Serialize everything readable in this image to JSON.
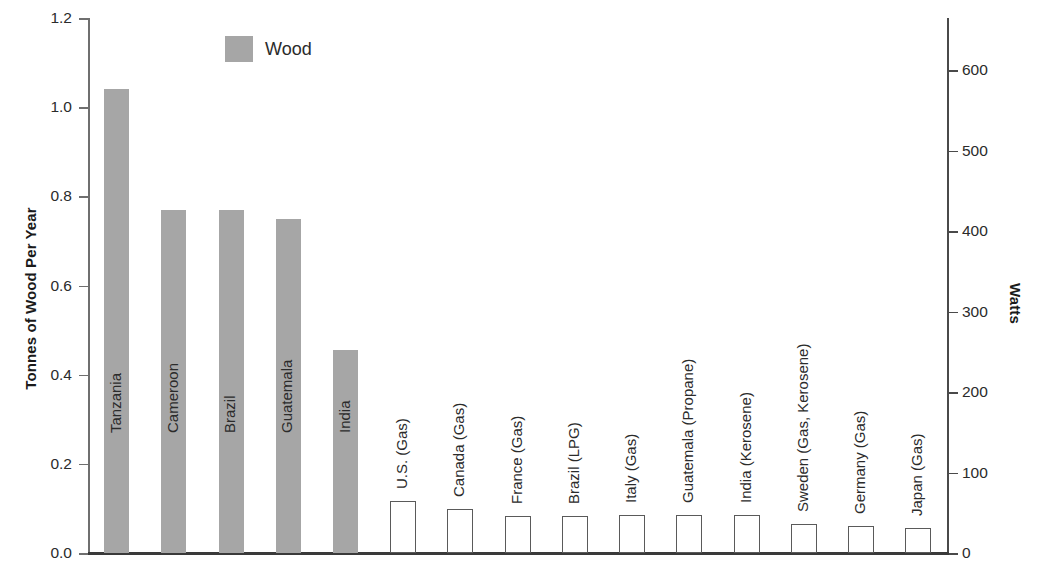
{
  "chart_data": {
    "type": "bar",
    "title": "",
    "ylabel": "Tonnes of Wood Per Year",
    "y2label": "Watts",
    "xlabel": "",
    "ylim": [
      0.0,
      1.2
    ],
    "y2lim": [
      0,
      600
    ],
    "grid": false,
    "legend_position": "top-left-inside",
    "legend": [
      {
        "name": "Wood",
        "color": "#a6a6a6"
      }
    ],
    "y_ticks": [
      "0.0",
      "0.2",
      "0.4",
      "0.6",
      "0.8",
      "1.0",
      "1.2"
    ],
    "y_tick_values": [
      0.0,
      0.2,
      0.4,
      0.6,
      0.8,
      1.0,
      1.2
    ],
    "y2_ticks": [
      "0",
      "100",
      "200",
      "300",
      "400",
      "500",
      "600"
    ],
    "y2_tick_values": [
      0,
      100,
      200,
      300,
      400,
      500,
      600
    ],
    "categories": [
      "Tanzania",
      "Cameroon",
      "Brazil",
      "Guatemala",
      "India",
      "U.S. (Gas)",
      "Canada (Gas)",
      "France (Gas)",
      "Brazil (LPG)",
      "Italy (Gas)",
      "Guatemala (Propane)",
      "India (Kerosene)",
      "Sweden (Gas, Kerosene)",
      "Germany (Gas)",
      "Japan (Gas)"
    ],
    "series": [
      {
        "name": "Wood",
        "unit": "Tonnes of Wood Per Year",
        "axis": "left",
        "style": "filled-gray",
        "values": [
          1.04,
          0.77,
          0.77,
          0.75,
          0.455,
          null,
          null,
          null,
          null,
          null,
          null,
          null,
          null,
          null,
          null
        ]
      },
      {
        "name": "Fuel",
        "unit": "Watts",
        "axis": "right",
        "style": "outlined-white",
        "values": [
          null,
          null,
          null,
          null,
          null,
          64,
          55,
          46,
          46,
          47,
          47,
          47,
          36,
          33,
          31
        ]
      }
    ]
  }
}
